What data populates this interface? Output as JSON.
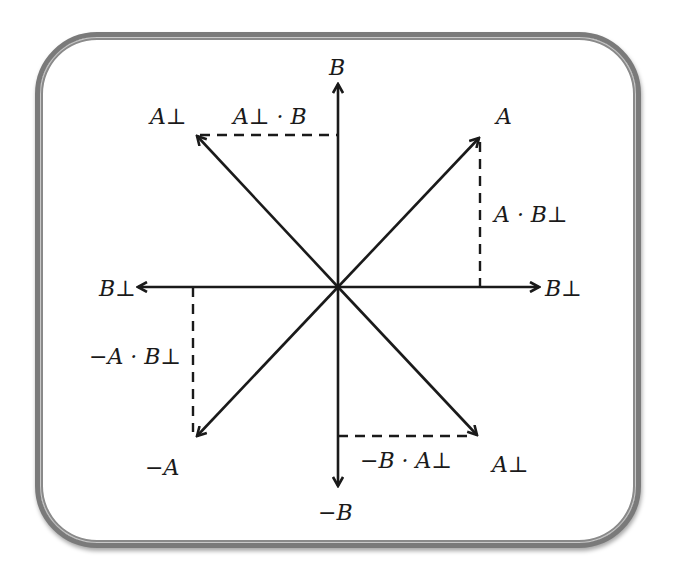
{
  "diagram": {
    "type": "vector-projection-diagram",
    "center": [
      338,
      287
    ],
    "colors": {
      "line": "#1a1a1a",
      "frame": "#7a7a7a",
      "background": "#ffffff"
    },
    "labels": {
      "b": "B",
      "neg_b": "−B",
      "b_perp_right": "B⊥",
      "b_perp_left": "B⊥",
      "a": "A",
      "neg_a": "−A",
      "a_perp_upper": "A⊥",
      "a_perp_lower": "A⊥",
      "a_perp_dot_b": "A⊥ · B",
      "a_dot_b_perp": "A · B⊥",
      "neg_a_dot_b_perp": "−A · B⊥",
      "neg_b_dot_a_perp": "−B · A⊥"
    },
    "vectors": [
      {
        "name": "B",
        "tip": [
          338,
          83
        ]
      },
      {
        "name": "-B",
        "tip": [
          338,
          487
        ]
      },
      {
        "name": "B-perp-right",
        "tip": [
          540,
          287
        ]
      },
      {
        "name": "B-perp-left",
        "tip": [
          137,
          287
        ]
      },
      {
        "name": "A",
        "tip": [
          480,
          137
        ]
      },
      {
        "name": "-A",
        "tip": [
          196,
          437
        ]
      },
      {
        "name": "A-perp-upper",
        "tip": [
          196,
          135
        ]
      },
      {
        "name": "A-perp-lower",
        "tip": [
          478,
          436
        ]
      }
    ],
    "projections": [
      {
        "name": "A-perp-dot-B",
        "from": [
          196,
          135
        ],
        "to": [
          338,
          135
        ]
      },
      {
        "name": "A-dot-B-perp",
        "from": [
          480,
          140
        ],
        "to": [
          480,
          287
        ]
      },
      {
        "name": "neg-A-dot-B-perp",
        "from": [
          193,
          287
        ],
        "to": [
          193,
          435
        ]
      },
      {
        "name": "neg-B-dot-A-perp",
        "from": [
          338,
          436
        ],
        "to": [
          478,
          436
        ]
      }
    ]
  }
}
